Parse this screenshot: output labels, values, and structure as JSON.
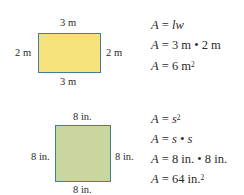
{
  "rectangle": {
    "fill": "#f6e27a",
    "border": "#3d7fa3",
    "labels": {
      "top": "3 m",
      "bottom": "3 m",
      "left": "2 m",
      "right": "2 m"
    },
    "equations": [
      {
        "lhs": "A",
        "op": "=",
        "rhs": "lw"
      },
      {
        "lhs": "A",
        "op": "=",
        "rhs": "3 m • 2 m"
      },
      {
        "lhs": "A",
        "op": "=",
        "rhs": "6 m",
        "sup": "2"
      }
    ]
  },
  "square": {
    "fill": "#c9d6a0",
    "border": "#3d7fa3",
    "labels": {
      "top": "8 in.",
      "bottom": "8 in.",
      "left": "8 in.",
      "right": "8 in."
    },
    "equations": [
      {
        "lhs": "A",
        "op": "=",
        "rhs": "s",
        "sup": "2"
      },
      {
        "lhs": "A",
        "op": "=",
        "rhs": "s • s"
      },
      {
        "lhs": "A",
        "op": "=",
        "rhs": "8 in. • 8 in."
      },
      {
        "lhs": "A",
        "op": "=",
        "rhs": "64 in.",
        "sup": "2"
      }
    ]
  }
}
